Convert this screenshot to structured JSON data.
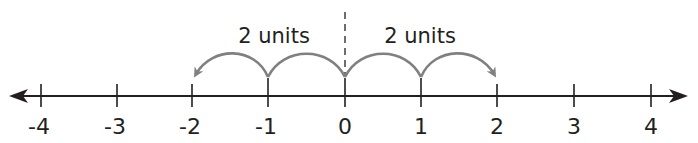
{
  "diagram": {
    "type": "number-line",
    "min": -4,
    "max": 4,
    "ticks": [
      {
        "value": -4,
        "label": "-4"
      },
      {
        "value": -3,
        "label": "-3"
      },
      {
        "value": -2,
        "label": "-2"
      },
      {
        "value": -1,
        "label": "-1"
      },
      {
        "value": 0,
        "label": "0"
      },
      {
        "value": 1,
        "label": "1"
      },
      {
        "value": 2,
        "label": "2"
      },
      {
        "value": 3,
        "label": "3"
      },
      {
        "value": 4,
        "label": "4"
      }
    ],
    "left_jumps": {
      "label": "2 units",
      "from": 0,
      "to": -2,
      "steps": 2
    },
    "right_jumps": {
      "label": "2 units",
      "from": 0,
      "to": 2,
      "steps": 2
    },
    "center_marker": {
      "value": 0,
      "style": "dashed"
    },
    "colors": {
      "axis": "#231f20",
      "arcs": "#808080",
      "text": "#231f20"
    }
  }
}
